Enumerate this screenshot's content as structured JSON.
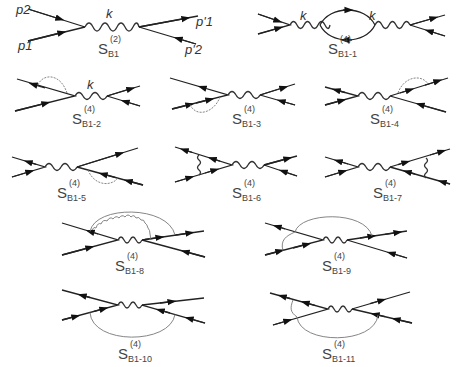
{
  "figure": {
    "line_color": "#222222",
    "radiative_line_color": "#777777"
  },
  "momentum_labels": {
    "p2": "p2",
    "p1": "p1",
    "p1_prime": "p'1",
    "p2_prime": "p'2",
    "k": "k"
  },
  "diagrams": [
    {
      "id": "S_B1",
      "S": "S",
      "order": "(2)",
      "sub": "B1"
    },
    {
      "id": "S_B1-1",
      "S": "S",
      "order": "(4)",
      "sub": "B1-1"
    },
    {
      "id": "S_B1-2",
      "S": "S",
      "order": "(4)",
      "sub": "B1-2"
    },
    {
      "id": "S_B1-3",
      "S": "S",
      "order": "(4)",
      "sub": "B1-3"
    },
    {
      "id": "S_B1-4",
      "S": "S",
      "order": "(4)",
      "sub": "B1-4"
    },
    {
      "id": "S_B1-5",
      "S": "S",
      "order": "(4)",
      "sub": "B1-5"
    },
    {
      "id": "S_B1-6",
      "S": "S",
      "order": "(4)",
      "sub": "B1-6"
    },
    {
      "id": "S_B1-7",
      "S": "S",
      "order": "(4)",
      "sub": "B1-7"
    },
    {
      "id": "S_B1-8",
      "S": "S",
      "order": "(4)",
      "sub": "B1-8"
    },
    {
      "id": "S_B1-9",
      "S": "S",
      "order": "(4)",
      "sub": "B1-9"
    },
    {
      "id": "S_B1-10",
      "S": "S",
      "order": "(4)",
      "sub": "B1-10"
    },
    {
      "id": "S_B1-11",
      "S": "S",
      "order": "(4)",
      "sub": "B1-11"
    }
  ]
}
